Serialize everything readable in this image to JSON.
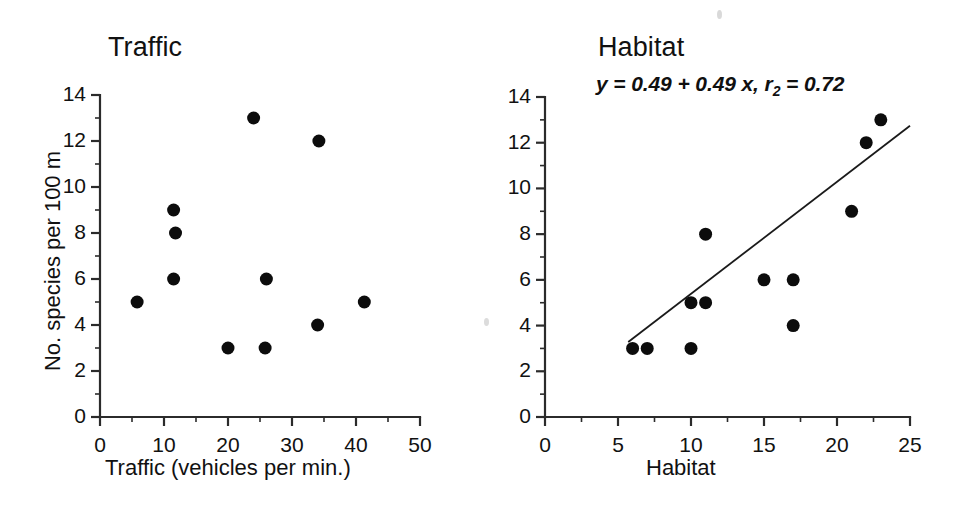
{
  "figure": {
    "background": "#ffffff",
    "ink_color": "#111111"
  },
  "panels": {
    "left": {
      "title": "Traffic",
      "xlabel": "Traffic (vehicles per min.)",
      "ylabel": "No. species per 100 m",
      "x_ticks": [
        "0",
        "10",
        "20",
        "30",
        "40",
        "50"
      ],
      "y_ticks": [
        "0",
        "2",
        "4",
        "6",
        "8",
        "10",
        "12",
        "14"
      ]
    },
    "right": {
      "title": "Habitat",
      "xlabel": "Habitat",
      "ylabel": "",
      "annotation": "y = 0.49 + 0.49 x, r2 = 0.72",
      "annotation_parts": {
        "before": "y = 0.49 + 0.49 x, r",
        "subscript": "2",
        "after": " = 0.72"
      },
      "x_ticks": [
        "0",
        "5",
        "10",
        "15",
        "20",
        "25"
      ],
      "y_ticks": [
        "0",
        "2",
        "4",
        "6",
        "8",
        "10",
        "12",
        "14"
      ]
    }
  },
  "chart_data": [
    {
      "type": "scatter",
      "title": "Traffic",
      "xlabel": "Traffic (vehicles per min.)",
      "ylabel": "No. species per 100 m",
      "xlim": [
        0,
        50
      ],
      "ylim": [
        0,
        14
      ],
      "xticks": [
        0,
        10,
        20,
        30,
        40,
        50
      ],
      "yticks": [
        0,
        2,
        4,
        6,
        8,
        10,
        12,
        14
      ],
      "xminor_step": 5,
      "yminor_step": 1,
      "grid": false,
      "legend": "none",
      "marker": {
        "shape": "circle",
        "color": "#0c0c0c",
        "radius": 6.5
      },
      "points": [
        {
          "x": 5.8,
          "y": 5
        },
        {
          "x": 11.5,
          "y": 9
        },
        {
          "x": 11.8,
          "y": 8
        },
        {
          "x": 11.5,
          "y": 6
        },
        {
          "x": 20.0,
          "y": 3
        },
        {
          "x": 24.0,
          "y": 13
        },
        {
          "x": 25.8,
          "y": 3
        },
        {
          "x": 26.0,
          "y": 6
        },
        {
          "x": 34.2,
          "y": 12
        },
        {
          "x": 34.0,
          "y": 4
        },
        {
          "x": 41.3,
          "y": 5
        }
      ]
    },
    {
      "type": "scatter",
      "title": "Habitat",
      "xlabel": "Habitat",
      "ylabel": "No. species per 100 m",
      "xlim": [
        0,
        25
      ],
      "ylim": [
        0,
        14
      ],
      "xticks": [
        0,
        5,
        10,
        15,
        20,
        25
      ],
      "yticks": [
        0,
        2,
        4,
        6,
        8,
        10,
        12,
        14
      ],
      "xminor_step": 2.5,
      "yminor_step": 1,
      "grid": false,
      "legend": "none",
      "annotation": "y = 0.49 + 0.49 x, r2 = 0.72",
      "marker": {
        "shape": "circle",
        "color": "#0c0c0c",
        "radius": 6.5
      },
      "points": [
        {
          "x": 6.0,
          "y": 3
        },
        {
          "x": 7.0,
          "y": 3
        },
        {
          "x": 10.0,
          "y": 5
        },
        {
          "x": 10.0,
          "y": 3
        },
        {
          "x": 11.0,
          "y": 5
        },
        {
          "x": 11.0,
          "y": 8
        },
        {
          "x": 15.0,
          "y": 6
        },
        {
          "x": 17.0,
          "y": 6
        },
        {
          "x": 17.0,
          "y": 4
        },
        {
          "x": 21.0,
          "y": 9
        },
        {
          "x": 22.0,
          "y": 12
        },
        {
          "x": 23.0,
          "y": 13
        }
      ],
      "fit": {
        "kind": "linear",
        "intercept": 0.49,
        "slope": 0.49,
        "r2": 0.72,
        "x_start": 5.7,
        "x_end": 25.0,
        "color": "#1a1a1a"
      }
    }
  ]
}
